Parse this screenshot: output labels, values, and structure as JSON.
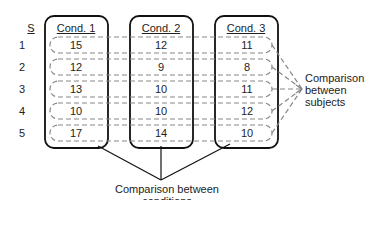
{
  "subject_header": "S",
  "subjects": [
    "1",
    "2",
    "3",
    "4",
    "5"
  ],
  "conditions": [
    {
      "label": "Cond. 1",
      "values": [
        "15",
        "12",
        "13",
        "10",
        "17"
      ]
    },
    {
      "label": "Cond. 2",
      "values": [
        "12",
        "9",
        "10",
        "10",
        "14"
      ]
    },
    {
      "label": "Cond. 3",
      "values": [
        "11",
        "8",
        "11",
        "12",
        "10"
      ]
    }
  ],
  "labels": {
    "between_subjects": [
      "Comparison",
      "between",
      "subjects"
    ],
    "between_conditions": "Comparison between conditions"
  }
}
